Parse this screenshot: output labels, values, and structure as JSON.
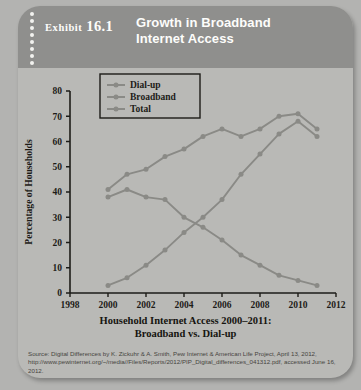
{
  "header": {
    "exhibit_label": "Exhibit",
    "exhibit_number": "16.1",
    "title_line1": "Growth in Broadband",
    "title_line2": "Internet Access"
  },
  "caption": {
    "line1": "Household Internet Access 2000–2011:",
    "line2": "Broadband vs. Dial-up"
  },
  "source": {
    "text": "Source: Digital Differences by K. Zickuhr & A. Smith, Pew Internet & American Life Project, April 13, 2012, http://www.pewinternet.org/~/media//Files/Reports/2012/PIP_Digital_differences_041312.pdf, accessed June 16, 2012."
  },
  "colors": {
    "card_bg": "#b9b9b6",
    "header_bg": "#8f8f8d",
    "header_text": "#fdfdfb",
    "axis": "#1d1c18",
    "line_dialup": "#8a8a86",
    "line_broadband": "#8a8a86",
    "line_total": "#8a8a86",
    "caption_text": "#15140f",
    "source_text": "#46443e"
  },
  "chart_data": {
    "type": "line",
    "title": "Household Internet Access 2000–2011: Broadband vs. Dial-up",
    "xlabel": "",
    "ylabel": "Percentage of Households",
    "xlim": [
      1998,
      2012
    ],
    "ylim": [
      0,
      80
    ],
    "xticks": [
      1998,
      2000,
      2002,
      2004,
      2006,
      2008,
      2010,
      2012
    ],
    "xtick_labels": [
      "1998",
      "2000",
      "2002",
      "2004",
      "2006",
      "2008",
      "2010",
      "2012"
    ],
    "yticks": [
      0,
      10,
      20,
      30,
      40,
      50,
      60,
      70,
      80
    ],
    "ytick_labels": [
      "0",
      "10",
      "20",
      "30",
      "40",
      "50",
      "60",
      "70",
      "80"
    ],
    "grid": false,
    "legend_position": "upper-left",
    "x": [
      2000,
      2001,
      2002,
      2003,
      2004,
      2005,
      2006,
      2007,
      2008,
      2009,
      2010,
      2011
    ],
    "series": [
      {
        "name": "Dial-up",
        "values": [
          38,
          41,
          38,
          37,
          30,
          26,
          21,
          15,
          11,
          7,
          5,
          3
        ]
      },
      {
        "name": "Broadband",
        "values": [
          3,
          6,
          11,
          17,
          24,
          30,
          37,
          47,
          55,
          63,
          68,
          62
        ]
      },
      {
        "name": "Total",
        "values": [
          41,
          47,
          49,
          54,
          57,
          62,
          65,
          62,
          65,
          70,
          71,
          65
        ]
      }
    ]
  }
}
